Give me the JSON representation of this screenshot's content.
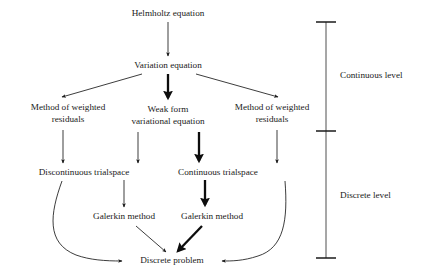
{
  "figure": {
    "type": "flowchart",
    "background_color": "#ffffff",
    "line_color": "#1a1a1a",
    "emphasis_color": "#0d0d0d"
  },
  "nodes": {
    "helmholtz": {
      "label": "Helmholtz equation",
      "x": 168,
      "y": 14
    },
    "variation": {
      "label": "Variation equation",
      "x": 168,
      "y": 66
    },
    "mwr_left_line1": {
      "label": "Method of weighted",
      "x": 68,
      "y": 108
    },
    "mwr_left_line2": {
      "label": "residuals",
      "x": 68,
      "y": 120
    },
    "weak_line1": {
      "label": "Weak form",
      "x": 168,
      "y": 110
    },
    "weak_line2": {
      "label": "variational equation",
      "x": 168,
      "y": 122
    },
    "mwr_right_line1": {
      "label": "Method of weighted",
      "x": 272,
      "y": 108
    },
    "mwr_right_line2": {
      "label": "residuals",
      "x": 272,
      "y": 120
    },
    "disc_trial": {
      "label": "Discontinuous trialspace",
      "x": 84,
      "y": 173
    },
    "cont_trial": {
      "label": "Continuous trialspace",
      "x": 218,
      "y": 173
    },
    "galerkin_left": {
      "label": "Galerkin method",
      "x": 124,
      "y": 217
    },
    "galerkin_right": {
      "label": "Galerkin method",
      "x": 212,
      "y": 217
    },
    "discrete_problem": {
      "label": "Discrete problem",
      "x": 172,
      "y": 261
    }
  },
  "levels": {
    "continuous": {
      "label": "Continuous level",
      "x": 340,
      "y": 76
    },
    "discrete": {
      "label": "Discrete level",
      "x": 340,
      "y": 196
    },
    "bar_x": 326,
    "tick_top_y": 22,
    "tick_mid_y": 131,
    "tick_bottom_y": 258
  },
  "edges": [
    {
      "name": "helmholtz-to-variation",
      "from": "helmholtz",
      "to": "variation",
      "weight": "thin"
    },
    {
      "name": "variation-to-mwr-left",
      "from": "variation",
      "to": "mwr_left",
      "weight": "thin"
    },
    {
      "name": "variation-to-weak-form",
      "from": "variation",
      "to": "weak",
      "weight": "bold"
    },
    {
      "name": "variation-to-mwr-right",
      "from": "variation",
      "to": "mwr_right",
      "weight": "thin"
    },
    {
      "name": "mwr-left-to-discontinuous-trialspace",
      "from": "mwr_left",
      "to": "disc_trial",
      "weight": "thin"
    },
    {
      "name": "weak-form-to-discontinuous-trialspace",
      "from": "weak",
      "to": "disc_trial",
      "weight": "thin"
    },
    {
      "name": "weak-form-to-continuous-trialspace",
      "from": "weak",
      "to": "cont_trial",
      "weight": "bold"
    },
    {
      "name": "mwr-right-to-continuous-trialspace",
      "from": "mwr_right",
      "to": "cont_trial",
      "weight": "thin"
    },
    {
      "name": "discontinuous-trialspace-to-galerkin-left",
      "from": "disc_trial",
      "to": "galerkin_left",
      "weight": "thin"
    },
    {
      "name": "continuous-trialspace-to-galerkin-right",
      "from": "cont_trial",
      "to": "galerkin_right",
      "weight": "bold"
    },
    {
      "name": "discontinuous-trialspace-curve-to-discrete-problem",
      "from": "disc_trial",
      "to": "discrete_problem",
      "weight": "thin"
    },
    {
      "name": "galerkin-left-to-discrete-problem",
      "from": "galerkin_left",
      "to": "discrete_problem",
      "weight": "thin"
    },
    {
      "name": "galerkin-right-to-discrete-problem",
      "from": "galerkin_right",
      "to": "discrete_problem",
      "weight": "bold"
    },
    {
      "name": "mwr-right-curve-to-discrete-problem",
      "from": "mwr_right",
      "to": "discrete_problem",
      "weight": "thin"
    }
  ]
}
